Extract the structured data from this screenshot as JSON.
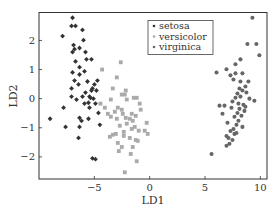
{
  "chart_data": {
    "type": "scatter",
    "title": "",
    "xlabel": "LD1",
    "ylabel": "LD2",
    "xlim": [
      -10.0,
      10.6
    ],
    "ylim": [
      -2.76,
      2.96
    ],
    "xticks": [
      -5,
      0,
      5,
      10
    ],
    "xtick_labels": [
      "−5",
      "0",
      "5",
      "10"
    ],
    "yticks": [
      -2,
      -1,
      0,
      1,
      2
    ],
    "ytick_labels": [
      "−2",
      "−1",
      "0",
      "1",
      "2"
    ],
    "grid": false,
    "legend_position": "upper center",
    "series": [
      {
        "name": "setosa",
        "marker": "diamond",
        "color": "#333333",
        "points": [
          [
            -6.97,
            2.78
          ],
          [
            -7.06,
            2.5
          ],
          [
            -6.7,
            2.5
          ],
          [
            -7.87,
            2.15
          ],
          [
            -6.07,
            2.36
          ],
          [
            -5.98,
            2.01
          ],
          [
            -6.88,
            1.84
          ],
          [
            -6.79,
            1.7
          ],
          [
            -6.97,
            1.6
          ],
          [
            -6.34,
            1.74
          ],
          [
            -5.8,
            1.6
          ],
          [
            -6.7,
            1.28
          ],
          [
            -5.71,
            1.35
          ],
          [
            -6.34,
            1.08
          ],
          [
            -5.26,
            1.35
          ],
          [
            -6.97,
            0.9
          ],
          [
            -5.89,
            0.94
          ],
          [
            -6.34,
            0.83
          ],
          [
            -5.62,
            0.59
          ],
          [
            -6.79,
            0.62
          ],
          [
            -6.43,
            0.49
          ],
          [
            -4.72,
            0.62
          ],
          [
            -4.99,
            0.49
          ],
          [
            -5.17,
            0.35
          ],
          [
            -5.26,
            0.28
          ],
          [
            -5.8,
            0.21
          ],
          [
            -4.81,
            0.28
          ],
          [
            -7.06,
            0.35
          ],
          [
            -6.61,
            -0.03
          ],
          [
            -5.44,
            0.07
          ],
          [
            -6.07,
            0.07
          ],
          [
            -5.35,
            0.03
          ],
          [
            -5.08,
            0.0
          ],
          [
            -5.53,
            -0.14
          ],
          [
            -4.9,
            -0.17
          ],
          [
            -7.06,
            0.07
          ],
          [
            -5.89,
            -0.17
          ],
          [
            -5.44,
            -0.31
          ],
          [
            -7.78,
            -0.31
          ],
          [
            -6.34,
            -0.66
          ],
          [
            -5.53,
            -0.69
          ],
          [
            -6.16,
            -0.76
          ],
          [
            -4.63,
            -0.49
          ],
          [
            -9.0,
            -0.69
          ],
          [
            -7.6,
            -0.97
          ],
          [
            -6.34,
            -0.97
          ],
          [
            -4.5,
            -0.9
          ],
          [
            -6.43,
            -1.35
          ],
          [
            -5.17,
            -2.05
          ],
          [
            -4.9,
            -2.08
          ]
        ]
      },
      {
        "name": "versicolor",
        "marker": "square",
        "color": "#aaaaaa",
        "points": [
          [
            -2.61,
            1.25
          ],
          [
            -4.3,
            1.0
          ],
          [
            -2.97,
            0.73
          ],
          [
            -2.16,
            0.28
          ],
          [
            -2.25,
            0.14
          ],
          [
            -4.45,
            -0.17
          ],
          [
            -3.51,
            -0.03
          ],
          [
            -2.52,
            0.14
          ],
          [
            -2.52,
            -0.38
          ],
          [
            -2.07,
            -0.03
          ],
          [
            -1.44,
            0.03
          ],
          [
            -1.17,
            0.03
          ],
          [
            -2.88,
            -0.31
          ],
          [
            -3.15,
            -0.45
          ],
          [
            -2.43,
            -0.52
          ],
          [
            -1.62,
            -0.52
          ],
          [
            -2.97,
            -0.69
          ],
          [
            -3.51,
            -0.62
          ],
          [
            -1.8,
            -0.69
          ],
          [
            -2.16,
            -0.66
          ],
          [
            -1.26,
            -0.59
          ],
          [
            -0.81,
            -0.38
          ],
          [
            -1.53,
            -0.76
          ],
          [
            -2.7,
            -0.93
          ],
          [
            -2.07,
            -0.86
          ],
          [
            -1.35,
            -0.97
          ],
          [
            -1.62,
            -1.04
          ],
          [
            -0.99,
            -1.1
          ],
          [
            -2.34,
            -1.14
          ],
          [
            -3.06,
            -1.21
          ],
          [
            -2.34,
            -1.28
          ],
          [
            -1.8,
            -1.35
          ],
          [
            -1.26,
            -1.42
          ],
          [
            -2.88,
            -1.52
          ],
          [
            -2.52,
            -1.66
          ],
          [
            -0.27,
            -0.83
          ],
          [
            -0.18,
            -1.21
          ],
          [
            -2.79,
            -1.8
          ],
          [
            -1.71,
            -1.9
          ],
          [
            -1.17,
            -2.15
          ],
          [
            -0.45,
            -1.1
          ],
          [
            -4.05,
            -0.31
          ],
          [
            -3.78,
            -0.52
          ],
          [
            -3.33,
            -1.24
          ],
          [
            -3.6,
            -1.31
          ],
          [
            -1.08,
            -1.45
          ],
          [
            -0.9,
            -0.17
          ],
          [
            -3.33,
            0.35
          ],
          [
            -1.53,
            -1.66
          ],
          [
            -2.25,
            -2.53
          ]
        ]
      },
      {
        "name": "virginica",
        "marker": "circle",
        "color": "#666666",
        "points": [
          [
            9.28,
            2.78
          ],
          [
            8.83,
            1.88
          ],
          [
            9.64,
            1.88
          ],
          [
            9.91,
            1.49
          ],
          [
            8.2,
            1.35
          ],
          [
            7.75,
            1.18
          ],
          [
            6.94,
            1.01
          ],
          [
            7.75,
            0.87
          ],
          [
            8.38,
            0.87
          ],
          [
            6.04,
            0.9
          ],
          [
            7.3,
            0.8
          ],
          [
            7.57,
            0.66
          ],
          [
            8.2,
            0.59
          ],
          [
            8.92,
            0.59
          ],
          [
            8.65,
            0.42
          ],
          [
            8.38,
            0.28
          ],
          [
            8.74,
            0.21
          ],
          [
            7.93,
            0.18
          ],
          [
            8.2,
            0.07
          ],
          [
            9.01,
            0.0
          ],
          [
            7.75,
            0.03
          ],
          [
            7.48,
            -0.1
          ],
          [
            8.02,
            -0.17
          ],
          [
            8.47,
            -0.21
          ],
          [
            6.31,
            -0.24
          ],
          [
            6.76,
            -0.24
          ],
          [
            7.39,
            -0.31
          ],
          [
            8.11,
            -0.35
          ],
          [
            8.56,
            -0.42
          ],
          [
            7.93,
            -0.49
          ],
          [
            8.29,
            -0.59
          ],
          [
            7.66,
            -0.62
          ],
          [
            8.02,
            -0.76
          ],
          [
            7.84,
            -0.9
          ],
          [
            8.38,
            -0.97
          ],
          [
            7.57,
            -1.04
          ],
          [
            7.3,
            -1.11
          ],
          [
            7.84,
            -1.18
          ],
          [
            6.94,
            -1.28
          ],
          [
            7.12,
            -1.35
          ],
          [
            7.48,
            -1.42
          ],
          [
            7.21,
            -1.55
          ],
          [
            6.94,
            -1.62
          ],
          [
            5.59,
            -1.9
          ],
          [
            9.46,
            -0.07
          ],
          [
            7.03,
            -0.83
          ],
          [
            8.65,
            -0.28
          ],
          [
            6.58,
            -0.52
          ],
          [
            7.66,
            -1.21
          ],
          [
            8.11,
            0.35
          ]
        ]
      }
    ]
  }
}
